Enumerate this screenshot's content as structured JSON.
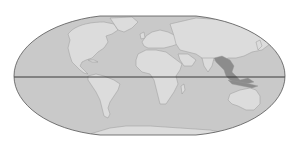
{
  "map": {
    "projection": "flat-polar-pseudocylindrical",
    "description": "World map with equator line; Southeast Asia highlighted",
    "colors": {
      "background": "#ffffff",
      "ocean": "#c9c9c9",
      "land": "#dcdcdc",
      "coast": "#9a9a9a",
      "highlight": "#8c8c8c",
      "outline": "#555555",
      "equator": "#2a2a2a"
    },
    "features": {
      "equator": {
        "label": "Equator",
        "latitude": 0
      },
      "highlighted_region": {
        "label": "Southeast Asia"
      }
    },
    "landmasses": [
      {
        "name": "North America"
      },
      {
        "name": "Greenland"
      },
      {
        "name": "South America"
      },
      {
        "name": "Europe"
      },
      {
        "name": "Africa"
      },
      {
        "name": "Madagascar"
      },
      {
        "name": "Asia"
      },
      {
        "name": "Arabian Peninsula"
      },
      {
        "name": "Indian Subcontinent"
      },
      {
        "name": "Australia"
      },
      {
        "name": "Antarctica"
      },
      {
        "name": "Japan"
      },
      {
        "name": "British Isles"
      }
    ]
  }
}
